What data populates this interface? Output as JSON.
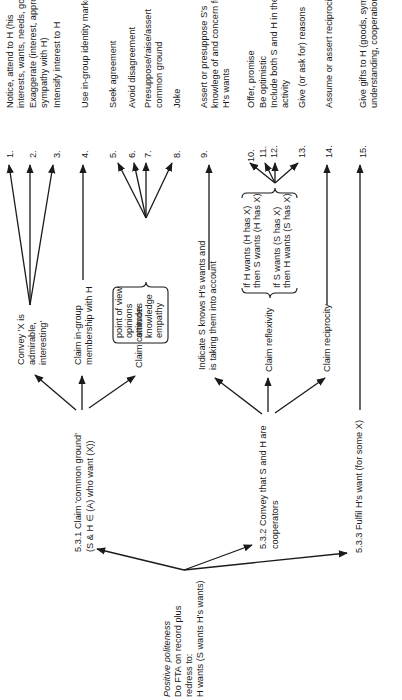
{
  "diagram": {
    "orientation": "rotated 90deg counter-clockwise",
    "root": {
      "lines": [
        "Positive politeness",
        "Do FTA on record plus",
        "redress to:",
        "H wants (S wants H's wants)"
      ]
    },
    "branches": [
      {
        "id": "5.3.1",
        "lines": [
          "5.3.1 Claim 'common ground'",
          "(S & H ∈ (A) who want (X))"
        ],
        "children": [
          {
            "lines": [
              "Convey 'X is",
              "admirable,",
              "interesting'"
            ]
          },
          {
            "lines": [
              "Claim in-group",
              "membership with H"
            ]
          },
          {
            "lines": [
              "Claim common"
            ],
            "brace_items": [
              "point of view",
              "opinions",
              "attitudes",
              "knowledge",
              "empathy"
            ]
          }
        ]
      },
      {
        "id": "5.3.2",
        "lines": [
          "5.3.2 Convey that S and H are",
          "cooperators"
        ],
        "children": [
          {
            "lines": [
              "Indicate S knows H's wants and",
              "is taking them into account"
            ]
          },
          {
            "lines": [
              "Claim reflexivity"
            ],
            "brace_items": [
              "If H wants (H has X)",
              "then S wants (H has X)",
              "If S wants (S has X)",
              "then H wants (S has X)"
            ]
          },
          {
            "lines": [
              "Claim reciprocity"
            ]
          }
        ]
      },
      {
        "id": "5.3.3",
        "lines": [
          "5.3.3 Fulfil H's want (for some X)"
        ]
      }
    ],
    "strategies": [
      {
        "num": "1.",
        "lines": [
          "Notice, attend to H (his",
          "interests, wants, needs, goods)"
        ]
      },
      {
        "num": "2.",
        "lines": [
          "Exaggerate (interest, approval,",
          "sympathy with H)"
        ]
      },
      {
        "num": "3.",
        "lines": [
          "Intensify interest to H"
        ]
      },
      {
        "num": "4.",
        "lines": [
          "Use in-group identity markers"
        ]
      },
      {
        "num": "5.",
        "lines": [
          "Seek agreement"
        ]
      },
      {
        "num": "6.",
        "lines": [
          "Avoid disagreement"
        ]
      },
      {
        "num": "7.",
        "lines": [
          "Presuppose/raise/assert",
          "common ground"
        ]
      },
      {
        "num": "8.",
        "lines": [
          "Joke"
        ]
      },
      {
        "num": "9.",
        "lines": [
          "Assert or presuppose S's",
          "knowlege of and concern for",
          "H's wants"
        ]
      },
      {
        "num": "10.",
        "lines": [
          "Offer, promise"
        ]
      },
      {
        "num": "11.",
        "lines": [
          "Be optimistic"
        ]
      },
      {
        "num": "12.",
        "lines": [
          "Include both S and H in the",
          "activity"
        ]
      },
      {
        "num": "13.",
        "lines": [
          "Give (or ask for) reasons"
        ]
      },
      {
        "num": "14.",
        "lines": [
          "Assume or assert reciprocity"
        ]
      },
      {
        "num": "15.",
        "lines": [
          "Give gifts to H (goods, sympathy,",
          "understanding, cooperation)"
        ]
      }
    ]
  }
}
